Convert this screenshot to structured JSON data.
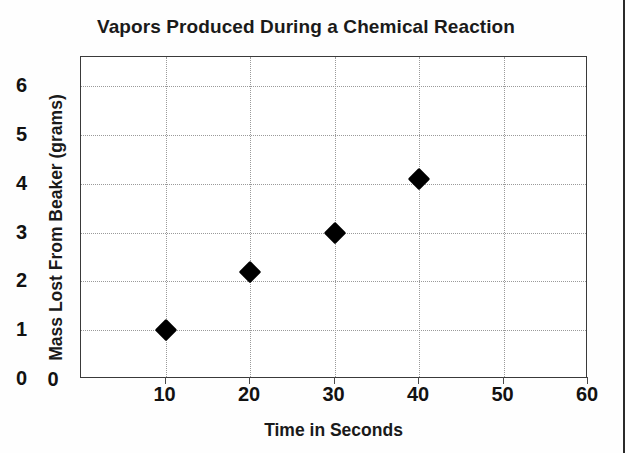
{
  "chart_data": {
    "type": "scatter",
    "title": "Vapors Produced During a Chemical Reaction",
    "xlabel": "Time in Seconds",
    "ylabel": "Mass Lost From Beaker (grams)",
    "x": [
      10,
      20,
      30,
      40
    ],
    "values": [
      1,
      2.2,
      3,
      4.1
    ],
    "points": [
      {
        "x": 10,
        "y": 1
      },
      {
        "x": 20,
        "y": 2.2
      },
      {
        "x": 30,
        "y": 3
      },
      {
        "x": 40,
        "y": 4.1
      }
    ],
    "xlim": [
      0,
      60
    ],
    "ylim": [
      0,
      6.6
    ],
    "xticks": [
      0,
      10,
      20,
      30,
      40,
      50,
      60
    ],
    "yticks": [
      0,
      1,
      2,
      3,
      4,
      5,
      6
    ],
    "xtick_labels": [
      "0",
      "10",
      "20",
      "30",
      "40",
      "50",
      "60"
    ],
    "ytick_labels": [
      "0",
      "1",
      "2",
      "3",
      "4",
      "5",
      "6"
    ],
    "grid": true,
    "legend": false,
    "marker": "diamond",
    "marker_color": "#000000"
  },
  "axis": {
    "x_ticks": [
      {
        "label": "0",
        "value": 0
      },
      {
        "label": "10",
        "value": 10
      },
      {
        "label": "20",
        "value": 20
      },
      {
        "label": "30",
        "value": 30
      },
      {
        "label": "40",
        "value": 40
      },
      {
        "label": "50",
        "value": 50
      },
      {
        "label": "60",
        "value": 60
      }
    ],
    "y_ticks": [
      {
        "label": "0",
        "value": 0
      },
      {
        "label": "1",
        "value": 1
      },
      {
        "label": "2",
        "value": 2
      },
      {
        "label": "3",
        "value": 3
      },
      {
        "label": "4",
        "value": 4
      },
      {
        "label": "5",
        "value": 5
      },
      {
        "label": "6",
        "value": 6
      }
    ]
  },
  "colors": {
    "marker": "#000000",
    "frame": "#3a3a3a",
    "grid": "#9a9a9a",
    "text": "#1a1a1a",
    "background": "#ffffff"
  }
}
